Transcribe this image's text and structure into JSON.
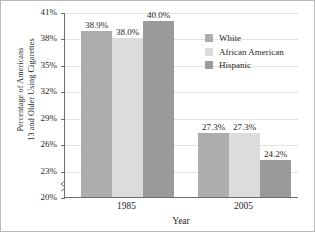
{
  "chart_data": {
    "type": "bar",
    "title": "",
    "xlabel": "Year",
    "ylabel_line1": "Percentage of Americans",
    "ylabel_line2": "13 and Older Using Cigarettes",
    "categories": [
      "1985",
      "2005"
    ],
    "series": [
      {
        "name": "White",
        "color": "#adadad",
        "values": [
          38.9,
          27.3
        ],
        "labels": [
          "38.9%",
          "27.3%"
        ]
      },
      {
        "name": "African American",
        "color": "#dcdcdc",
        "values": [
          38.0,
          27.3
        ],
        "labels": [
          "38.0%",
          "27.3%"
        ]
      },
      {
        "name": "Hispanic",
        "color": "#9a9a9a",
        "values": [
          40.0,
          24.2
        ],
        "labels": [
          "40.0%",
          "24.2%"
        ]
      }
    ],
    "ylim": [
      20,
      41
    ],
    "yticks": [
      "20%",
      "23%",
      "26%",
      "29%",
      "32%",
      "35%",
      "38%",
      "41%"
    ],
    "ytick_values": [
      20,
      23,
      26,
      29,
      32,
      35,
      38,
      41
    ],
    "grid": true,
    "legend_position": "top-right",
    "axis_break": true
  }
}
